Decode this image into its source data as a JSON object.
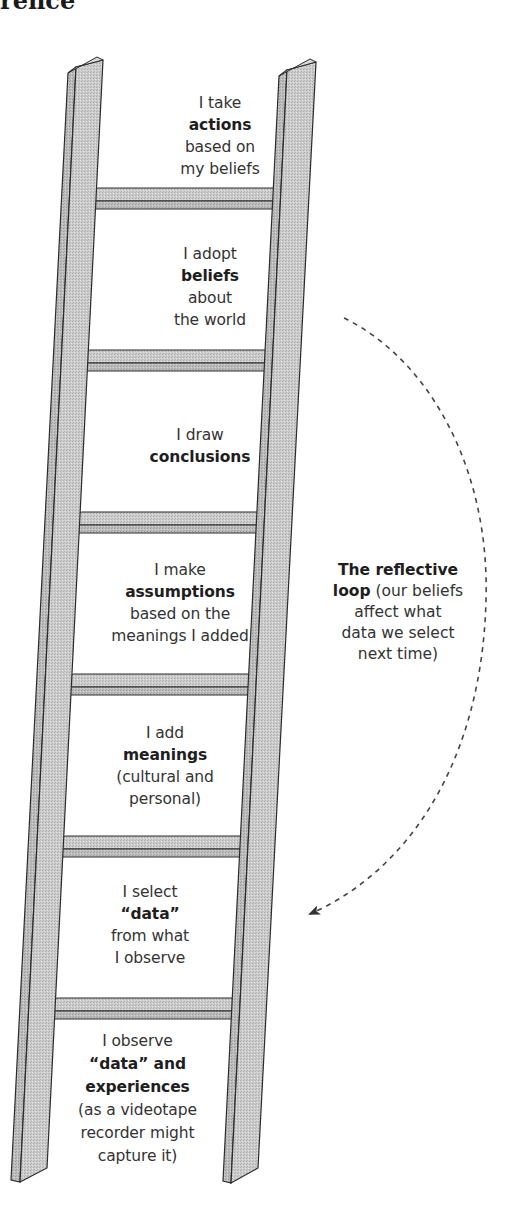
{
  "header": {
    "partial_title": "rence"
  },
  "ladder": {
    "rungs": [
      {
        "id": "actions",
        "lines": [
          {
            "text": "I take",
            "bold": false
          },
          {
            "text": "actions",
            "bold": true
          },
          {
            "text": "based on",
            "bold": false
          },
          {
            "text": "my beliefs",
            "bold": false
          }
        ]
      },
      {
        "id": "beliefs",
        "lines": [
          {
            "text": "I adopt",
            "bold": false
          },
          {
            "text": "beliefs",
            "bold": true
          },
          {
            "text": "about",
            "bold": false
          },
          {
            "text": "the world",
            "bold": false
          }
        ]
      },
      {
        "id": "conclusions",
        "lines": [
          {
            "text": "I draw",
            "bold": false
          },
          {
            "text": "conclusions",
            "bold": true
          }
        ]
      },
      {
        "id": "assumptions",
        "lines": [
          {
            "text": "I make",
            "bold": false
          },
          {
            "text": "assumptions",
            "bold": true
          },
          {
            "text": "based on the",
            "bold": false
          },
          {
            "text": "meanings I added",
            "bold": false
          }
        ]
      },
      {
        "id": "meanings",
        "lines": [
          {
            "text": "I add",
            "bold": false
          },
          {
            "text": "meanings",
            "bold": true
          },
          {
            "text": "(cultural and",
            "bold": false
          },
          {
            "text": "personal)",
            "bold": false
          }
        ]
      },
      {
        "id": "select-data",
        "lines": [
          {
            "text": "I select",
            "bold": false
          },
          {
            "text": "“data”",
            "bold": true
          },
          {
            "text": "from what",
            "bold": false
          },
          {
            "text": "I observe",
            "bold": false
          }
        ]
      },
      {
        "id": "observe-data",
        "lines": [
          {
            "text": "I observe",
            "bold": false
          },
          {
            "text": "“data” and",
            "bold": true
          },
          {
            "text": "experiences",
            "bold": true
          },
          {
            "text": "(as a videotape",
            "bold": false
          },
          {
            "text": "recorder might",
            "bold": false
          },
          {
            "text": "capture it)",
            "bold": false
          }
        ]
      }
    ]
  },
  "reflective_loop": {
    "bold_text": "The reflective loop",
    "rest_text": " (our beliefs affect what data we select next time)",
    "lines": [
      {
        "bold": "The reflective",
        "plain": ""
      },
      {
        "bold": "loop",
        "plain": " (our beliefs"
      },
      {
        "bold": "",
        "plain": "affect what"
      },
      {
        "bold": "",
        "plain": "data we select"
      },
      {
        "bold": "",
        "plain": "next time)"
      }
    ],
    "arrow": {
      "direction": "from-beliefs-down-to-select-data",
      "style": "dashed"
    }
  },
  "colors": {
    "rail_fill": "#c9c9c9",
    "rail_side": "#b4b4b4",
    "outline": "#2b2b2b",
    "text": "#333333",
    "arrow": "#444444"
  }
}
